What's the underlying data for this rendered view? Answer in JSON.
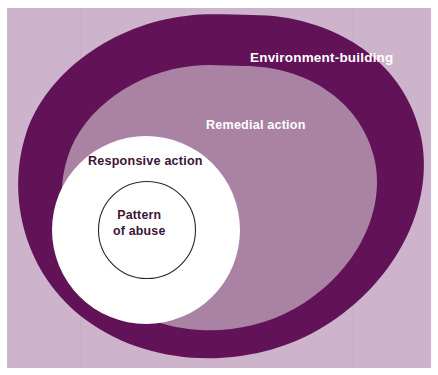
{
  "figure": {
    "type": "concentric-egg-diagram",
    "background_color": "#ffffff",
    "canvas": {
      "width": 438,
      "height": 375
    }
  },
  "colors": {
    "page_background": "#ffffff",
    "panel_background": "#cdb3cc",
    "outer_band": "#621257",
    "middle_region": "#a982a4",
    "inner_circle": "#ffffff",
    "core_circle_fill": "#ffffff",
    "core_circle_stroke": "#2e2430",
    "label_light": "#ffffff",
    "label_dark": "#3c1436",
    "faint_rule": "#c4a9c3"
  },
  "layers": [
    {
      "id": "environment-building",
      "label": "Environment-building",
      "shape": "egg",
      "fill": "#621257",
      "label_color": "#ffffff",
      "order": 1
    },
    {
      "id": "remedial-action",
      "label": "Remedial action",
      "shape": "egg",
      "fill": "#a982a4",
      "label_color": "#ffffff",
      "order": 2
    },
    {
      "id": "responsive-action",
      "label": "Responsive action",
      "shape": "circle",
      "fill": "#ffffff",
      "label_color": "#3c1436",
      "order": 3
    },
    {
      "id": "pattern-of-abuse",
      "label": "Pattern of abuse",
      "label_line_1": "Pattern",
      "label_line_2": "of abuse",
      "shape": "circle",
      "fill": "#ffffff",
      "stroke": "#2e2430",
      "label_color": "#3c1436",
      "order": 4
    }
  ],
  "labels": {
    "environment_building": "Environment-building",
    "remedial_action": "Remedial action",
    "responsive_action": "Responsive action",
    "pattern_line1": "Pattern",
    "pattern_line2": "of abuse"
  }
}
